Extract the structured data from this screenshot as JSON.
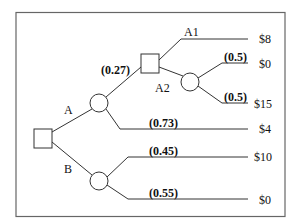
{
  "diagram": {
    "type": "decision-tree",
    "colors": {
      "line": "#333333",
      "text": "#111111",
      "background": "#ffffff"
    },
    "nodes": {
      "root": {
        "kind": "decision",
        "shape": "square"
      },
      "chance_a": {
        "kind": "chance",
        "shape": "circle"
      },
      "decision_a2": {
        "kind": "decision",
        "shape": "square"
      },
      "chance_a2": {
        "kind": "chance",
        "shape": "circle"
      },
      "chance_b": {
        "kind": "chance",
        "shape": "circle"
      }
    },
    "branches": {
      "root_a": {
        "label": "A"
      },
      "root_b": {
        "label": "B"
      },
      "a_up": {
        "prob": "(0.27)"
      },
      "a_down": {
        "prob": "(0.73)",
        "payoff": "$4"
      },
      "a2_a1": {
        "label": "A1",
        "payoff": "$8"
      },
      "a2_a2": {
        "label": "A2"
      },
      "a2_up": {
        "prob": "(0.5)",
        "payoff": "$0"
      },
      "a2_down": {
        "prob": "(0.5)",
        "payoff": "$15"
      },
      "b_up": {
        "prob": "(0.45)",
        "payoff": "$10"
      },
      "b_down": {
        "prob": "(0.55)",
        "payoff": "$0"
      }
    }
  }
}
